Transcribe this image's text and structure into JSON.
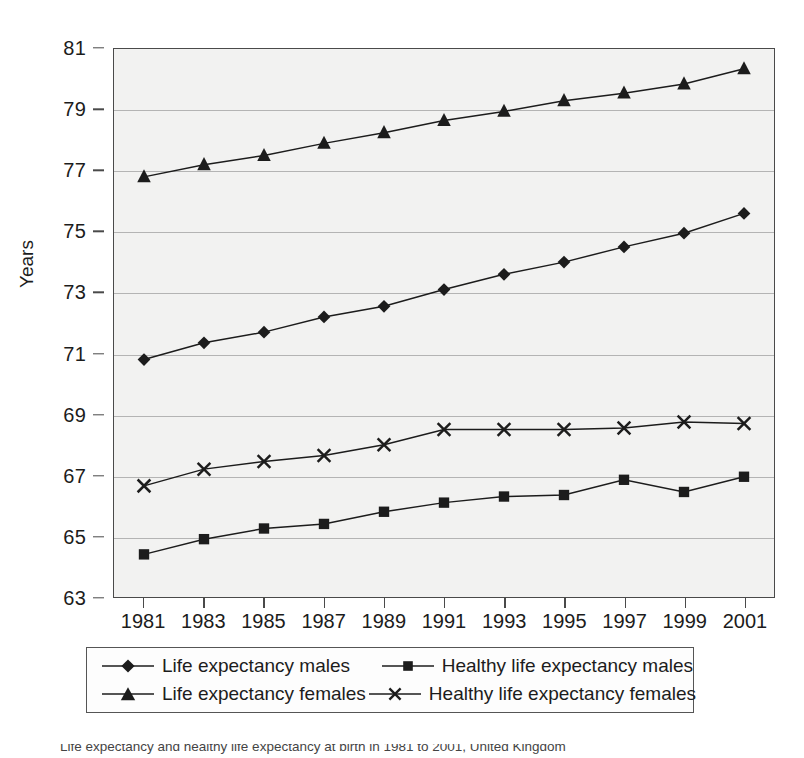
{
  "chart_data": {
    "type": "line",
    "title": "",
    "xlabel": "",
    "ylabel": "Years",
    "x": [
      1981,
      1983,
      1985,
      1987,
      1989,
      1991,
      1993,
      1995,
      1997,
      1999,
      2001
    ],
    "xtick_labels": [
      "1981",
      "1983",
      "1985",
      "1987",
      "1989",
      "1991",
      "1993",
      "1995",
      "1997",
      "1999",
      "2001"
    ],
    "ytick_labels": [
      "81",
      "79",
      "77",
      "75",
      "73",
      "71",
      "69",
      "67",
      "65",
      "63"
    ],
    "yticks": [
      81,
      79,
      77,
      75,
      73,
      71,
      69,
      67,
      65,
      63
    ],
    "ylim": [
      63,
      81
    ],
    "grid": true,
    "legend_position": "bottom",
    "series": [
      {
        "name": "Life expectancy males",
        "marker": "diamond",
        "values": [
          70.8,
          71.35,
          71.7,
          72.2,
          72.55,
          73.1,
          73.6,
          74.0,
          74.5,
          74.95,
          75.6
        ]
      },
      {
        "name": "Healthy life expectancy males",
        "marker": "square",
        "values": [
          64.4,
          64.9,
          65.25,
          65.4,
          65.8,
          66.1,
          66.3,
          66.35,
          66.85,
          66.45,
          66.95
        ]
      },
      {
        "name": "Life expectancy females",
        "marker": "triangle",
        "values": [
          76.8,
          77.2,
          77.5,
          77.9,
          78.25,
          78.65,
          78.95,
          79.3,
          79.55,
          79.85,
          80.35
        ]
      },
      {
        "name": "Healthy life expectancy females",
        "marker": "cross",
        "values": [
          66.65,
          67.2,
          67.45,
          67.65,
          68.0,
          68.5,
          68.5,
          68.5,
          68.55,
          68.75,
          68.7
        ]
      }
    ]
  },
  "colors": {
    "series_line": "#1c1c1c",
    "plot_background": "#f2f2f1",
    "gridline": "#b4b4b4",
    "axis": "#4a4a4a"
  },
  "caption": {
    "text": "Life expectancy and healthy life expectancy at birth in 1981 to 2001, United Kingdom"
  }
}
